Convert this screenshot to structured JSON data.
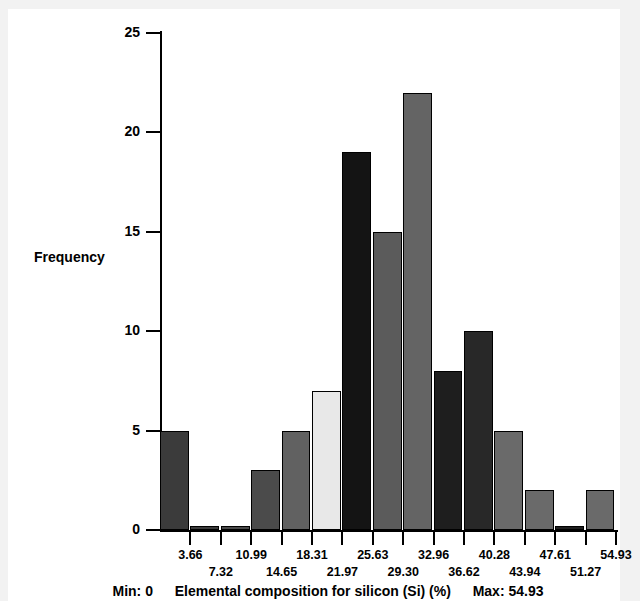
{
  "figure": {
    "background": "#f2f2f2",
    "paper": "#ffffff"
  },
  "chart_data": {
    "type": "bar",
    "title": "",
    "subtitle": "",
    "xlabel": "Elemental composition for silicon (Si) (%)",
    "ylabel": "Frequency",
    "xlim": [
      0,
      54.93
    ],
    "ylim": [
      0,
      25
    ],
    "grid": false,
    "legend": null,
    "bin_width": 3.662,
    "categories": [
      "3.66",
      "7.32",
      "10.99",
      "14.65",
      "18.31",
      "21.97",
      "25.63",
      "29.30",
      "32.96",
      "36.62",
      "40.28",
      "43.94",
      "47.61",
      "51.27",
      "54.93"
    ],
    "values": [
      5,
      0.2,
      0.2,
      3,
      5,
      7,
      19,
      15,
      22,
      8,
      10,
      5,
      2,
      0.2,
      2
    ],
    "bar_colors": [
      "#3b3b3b",
      "#3b3b3b",
      "#4a4a4a",
      "#4b4b4b",
      "#616161",
      "#e8e8e8",
      "#141414",
      "#5b5b5b",
      "#646464",
      "#1e1e1e",
      "#282828",
      "#6a6a6a",
      "#6a6a6a",
      "#1e1e1e",
      "#6a6a6a"
    ],
    "bar_edge_color": "#000000",
    "yticks": [
      0,
      5,
      10,
      15,
      20,
      25
    ],
    "ytick_labels": [
      "0",
      "5",
      "10",
      "15",
      "20",
      "25"
    ],
    "xtick_labels": [
      "3.66",
      "7.32",
      "10.99",
      "14.65",
      "18.31",
      "21.97",
      "25.63",
      "29.30",
      "32.96",
      "36.62",
      "40.28",
      "43.94",
      "47.61",
      "51.27",
      "54.93"
    ],
    "annotations": {
      "min_label": "Min: 0",
      "max_label": "Max: 54.93"
    }
  }
}
